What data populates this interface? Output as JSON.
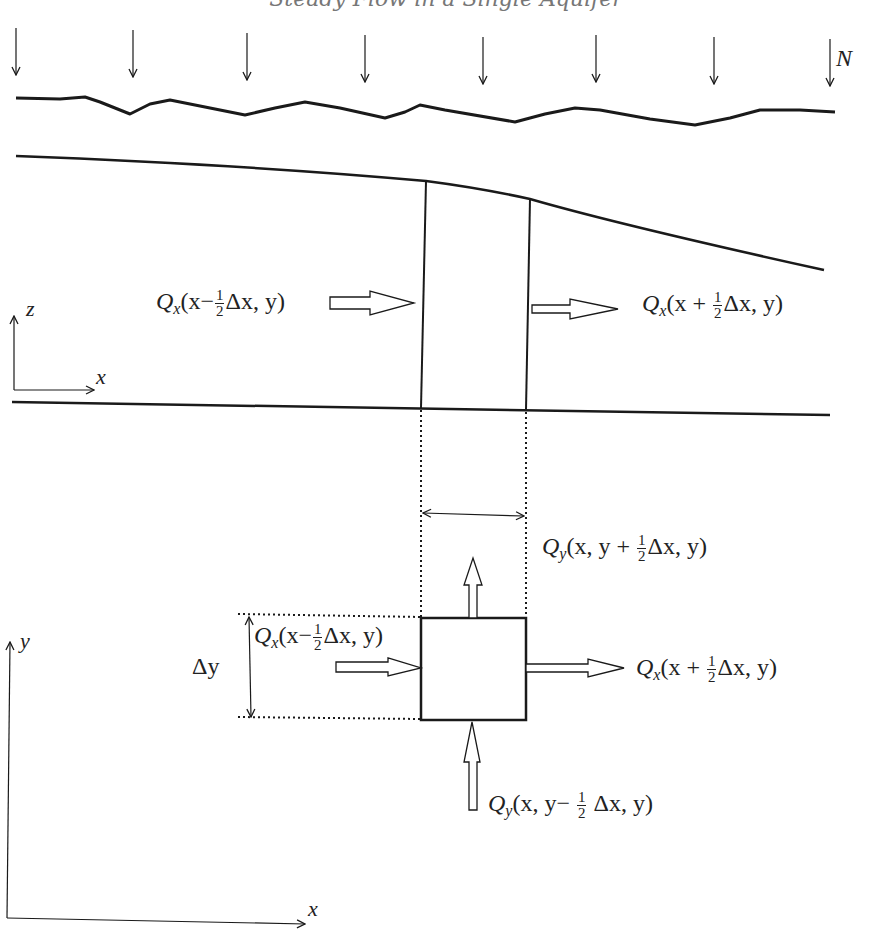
{
  "title": "Steady Flow in a Single Aquifer",
  "recharge": {
    "label": "N",
    "arrow_count": 8
  },
  "cross_section": {
    "axis": {
      "vertical": "z",
      "horizontal": "x"
    },
    "inflow_label": {
      "Q": "Q",
      "sub": "x",
      "pre": "(x−",
      "num": "1",
      "den": "2",
      "post": "Δx, y)"
    },
    "outflow_label": {
      "Q": "Q",
      "sub": "x",
      "pre": "(x + ",
      "num": "1",
      "den": "2",
      "post": "Δx, y)"
    }
  },
  "plan_view": {
    "axis": {
      "vertical": "y",
      "horizontal": "x"
    },
    "delta_y_label": "Δy",
    "qy_top_label": {
      "Q": "Q",
      "sub": "y",
      "pre": "(x, y + ",
      "num": "1",
      "den": "2",
      "post": "Δx, y)"
    },
    "qx_in_label": {
      "Q": "Q",
      "sub": "x",
      "pre": "(x−",
      "num": "1",
      "den": "2",
      "post": "Δx, y)"
    },
    "qx_out_label": {
      "Q": "Q",
      "sub": "x",
      "pre": "(x + ",
      "num": "1",
      "den": "2",
      "post": "Δx, y)"
    },
    "qy_bottom_label": {
      "Q": "Q",
      "sub": "y",
      "pre": "(x, y− ",
      "num": "1",
      "den": "2",
      "post": " Δx, y)"
    }
  },
  "colors": {
    "line": "#1a1a1a",
    "title": "#777777",
    "background": "#ffffff"
  }
}
